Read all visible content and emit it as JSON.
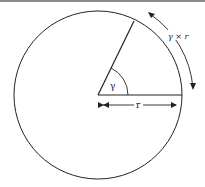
{
  "diagram": {
    "title": "",
    "labels": {
      "angle": "γ",
      "radius": "r",
      "arc_length": "γ × r"
    },
    "colors": {
      "stroke": "#222222",
      "top_rule": "#8a8a8a",
      "background": "#ffffff"
    },
    "geometry": {
      "circle_center": [
        98,
        95
      ],
      "circle_radius": 84
    }
  }
}
